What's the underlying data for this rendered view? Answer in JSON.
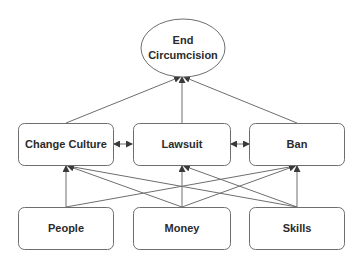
{
  "diagram": {
    "type": "flow",
    "colors": {
      "stroke": "#6e6e6e",
      "text": "#2b2b2b",
      "background": "#ffffff"
    },
    "goal": {
      "id": "end",
      "label_lines": [
        "End",
        "Circumcision"
      ],
      "shape": "ellipse"
    },
    "strategies": [
      {
        "id": "culture",
        "label": "Change Culture"
      },
      {
        "id": "lawsuit",
        "label": "Lawsuit"
      },
      {
        "id": "ban",
        "label": "Ban"
      }
    ],
    "resources": [
      {
        "id": "people",
        "label": "People"
      },
      {
        "id": "money",
        "label": "Money"
      },
      {
        "id": "skills",
        "label": "Skills"
      }
    ],
    "edges": [
      {
        "from": "culture",
        "to": "end"
      },
      {
        "from": "lawsuit",
        "to": "end"
      },
      {
        "from": "ban",
        "to": "end"
      },
      {
        "from": "culture",
        "to": "lawsuit",
        "bidirectional": true
      },
      {
        "from": "lawsuit",
        "to": "ban",
        "bidirectional": true
      },
      {
        "from": "people",
        "to": "culture"
      },
      {
        "from": "people",
        "to": "ban"
      },
      {
        "from": "money",
        "to": "culture"
      },
      {
        "from": "money",
        "to": "lawsuit"
      },
      {
        "from": "money",
        "to": "ban"
      },
      {
        "from": "skills",
        "to": "culture"
      },
      {
        "from": "skills",
        "to": "lawsuit"
      },
      {
        "from": "skills",
        "to": "ban"
      }
    ]
  }
}
